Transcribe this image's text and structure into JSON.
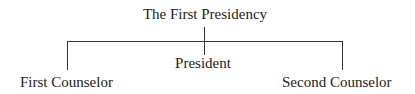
{
  "title": "The First Presidency",
  "nodes": {
    "center": "President",
    "left": "First Counselor",
    "right": "Second Counselor"
  }
}
